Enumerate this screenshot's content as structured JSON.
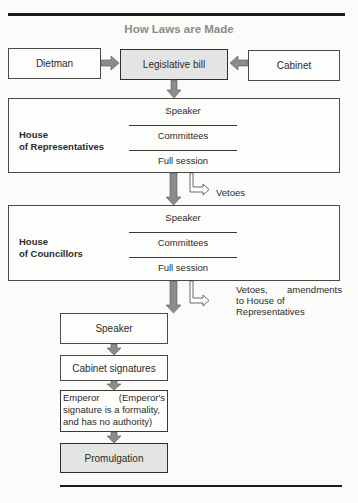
{
  "title": "How Laws are Made",
  "sources": {
    "left": "Dietman",
    "center": "Legislative bill",
    "right": "Cabinet"
  },
  "house_representatives": {
    "label_line1": "House",
    "label_line2": "of Representatives",
    "stages": [
      "Speaker",
      "Committees",
      "Full session"
    ],
    "side_exit": "Vetoes"
  },
  "house_councillors": {
    "label_line1": "House",
    "label_line2": "of Councillors",
    "stages": [
      "Speaker",
      "Committees",
      "Full session"
    ],
    "side_exit_lines": [
      "Vetoes, amendments",
      "to House of",
      "Representatives"
    ]
  },
  "final_steps": {
    "speaker": "Speaker",
    "cabinet": "Cabinet signatures",
    "emperor_lines": [
      "Emperor (Emperor's",
      "signature is a formality,",
      "and has no authority)"
    ],
    "promulgation": "Promulgation"
  },
  "colors": {
    "arrow_fill": "#8c8c8c",
    "shaded_box": "#e4e4e2",
    "title": "#8a8a8a"
  }
}
